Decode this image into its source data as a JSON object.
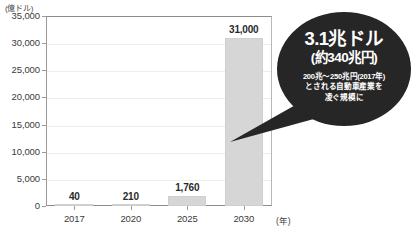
{
  "chart_data": {
    "type": "bar",
    "title": "",
    "xlabel": "(年)",
    "ylabel": "(億ドル)",
    "categories": [
      "2017",
      "2020",
      "2025",
      "2030"
    ],
    "values": [
      40,
      210,
      1760,
      31000
    ],
    "value_labels": [
      "40",
      "210",
      "1,760",
      "31,000"
    ],
    "ylim": [
      0,
      35000
    ],
    "ytick_labels": [
      "35,000",
      "30,000",
      "25,000",
      "20,000",
      "15,000",
      "10,000",
      "5,000",
      "0"
    ],
    "ytick_values": [
      35000,
      30000,
      25000,
      20000,
      15000,
      10000,
      5000,
      0
    ],
    "grid": true,
    "legend": "none",
    "bar_color": "#d6d6d6",
    "annotations": [
      {
        "headline": "3.1兆ドル",
        "subhead": "(約340兆円)",
        "note_lines": [
          "200兆〜250兆円(2017年)",
          "とされる自動車産業を",
          "凌ぐ規模に"
        ],
        "points_to_category": "2030",
        "background_color": "#262626",
        "text_color": "#ffffff"
      }
    ]
  },
  "axis": {
    "y_unit": "(億ドル)",
    "x_unit": "(年)"
  }
}
